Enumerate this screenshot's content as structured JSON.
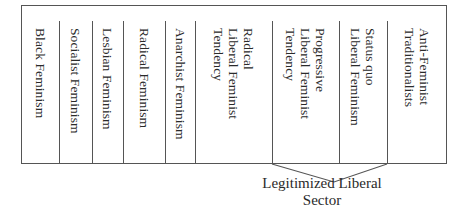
{
  "diagram": {
    "type": "spectrum-columns",
    "columns": [
      {
        "label": "Black Feminism"
      },
      {
        "label": "Socialist Feminism"
      },
      {
        "label": "Lesbian Feminism"
      },
      {
        "label": "Radical Feminism"
      },
      {
        "label": "Anarchist Feminism"
      },
      {
        "label": "Radical\nLiberal Feminist\nTendency"
      },
      {
        "label": "Progressive\nLiberal Feminist\nTendency"
      },
      {
        "label": "Status quo\nLiberal Feminism"
      },
      {
        "label": "Anti-Feminist\nTraditionalists"
      }
    ],
    "bracket": {
      "label_line1": "Legitimized Liberal",
      "label_line2": "Sector",
      "spans": [
        "Progressive Liberal Feminist Tendency",
        "Status quo Liberal Feminism"
      ]
    }
  },
  "colors": {
    "line": "#555555",
    "text": "#2a2a2a",
    "background": "#ffffff"
  }
}
